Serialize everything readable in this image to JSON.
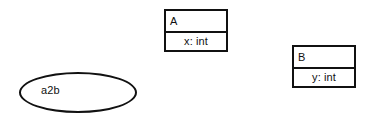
{
  "diagram": {
    "type": "uml-class-diagram",
    "background_color": "#ffffff",
    "stroke_color": "#111111",
    "text_color": "#111111",
    "classes": [
      {
        "name": "A",
        "attribute": "x: int",
        "x": 164,
        "y": 9,
        "width": 64,
        "height": 43,
        "divider_y": 22
      },
      {
        "name": "B",
        "attribute": "y: int",
        "x": 292,
        "y": 45,
        "width": 64,
        "height": 43,
        "divider_y": 22
      }
    ],
    "ellipses": [
      {
        "label": "a2b",
        "x": 19,
        "y": 72,
        "width": 118,
        "height": 41,
        "label_x": 41,
        "label_y": 85
      }
    ]
  }
}
